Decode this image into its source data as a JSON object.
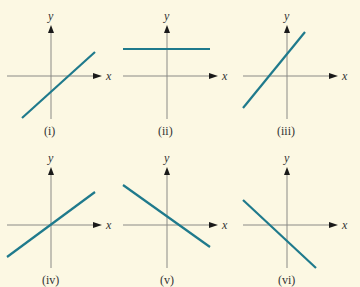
{
  "figure": {
    "background": "#fcf8e3",
    "line_color": "#1f7a8c",
    "axis_x_label": "x",
    "axis_y_label": "y",
    "panels": [
      {
        "caption": "(i)",
        "slope": "positive",
        "intercept": "negative"
      },
      {
        "caption": "(ii)",
        "slope": "zero",
        "intercept": "positive"
      },
      {
        "caption": "(iii)",
        "slope": "positive",
        "intercept": "positive"
      },
      {
        "caption": "(iv)",
        "slope": "positive",
        "intercept": "zero"
      },
      {
        "caption": "(v)",
        "slope": "negative",
        "intercept": "positive"
      },
      {
        "caption": "(vi)",
        "slope": "negative",
        "intercept": "negative"
      }
    ]
  }
}
